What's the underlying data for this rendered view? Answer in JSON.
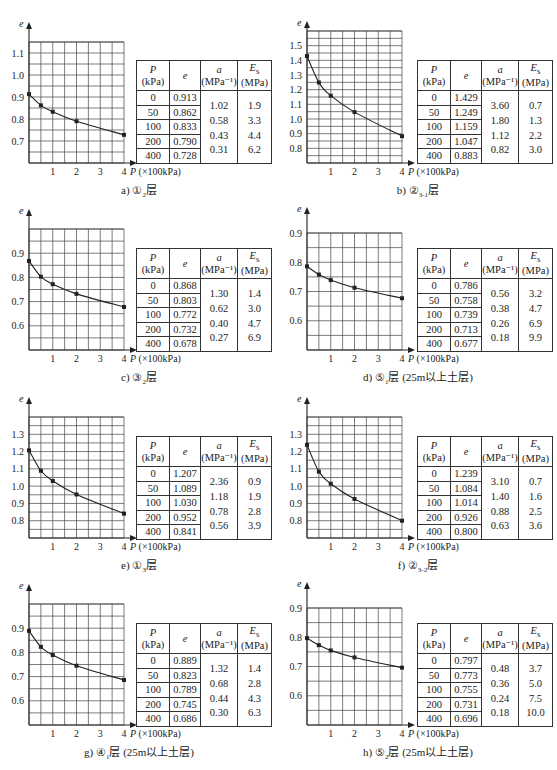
{
  "axis": {
    "y_label": "e",
    "x_label": "P (×100kPa)",
    "x_ticks": [
      "1",
      "2",
      "3",
      "4"
    ]
  },
  "table_headers": {
    "p": "P",
    "p_unit": "(kPa)",
    "e": "e",
    "a": "a",
    "a_unit": "(MPa⁻¹)",
    "es": "E",
    "es_sub": "s",
    "es_unit": "(MPa)"
  },
  "chart_data": [
    {
      "id": "a",
      "type": "line",
      "title": "a) ①₂层",
      "caption_prefix": "a) ①",
      "caption_sub": "2",
      "caption_suffix": "层",
      "xlabel": "P (×100kPa)",
      "ylabel": "e",
      "xlim": [
        0,
        4
      ],
      "ylim": [
        0.6,
        1.15
      ],
      "y_ticks": [
        0.7,
        0.8,
        0.9,
        1.0,
        1.1
      ],
      "y_tick_labels": [
        "0.7",
        "0.8",
        "0.9",
        "1.0",
        "1.1"
      ],
      "grid": true,
      "x": [
        0,
        0.5,
        1,
        2,
        4
      ],
      "P_kPa": [
        "0",
        "50",
        "100",
        "200",
        "400"
      ],
      "e": [
        "0.913",
        "0.862",
        "0.833",
        "0.790",
        "0.728"
      ],
      "a": [
        "1.02",
        "0.58",
        "0.43",
        "0.31"
      ],
      "Es": [
        "1.9",
        "3.3",
        "4.4",
        "6.2"
      ]
    },
    {
      "id": "b",
      "type": "line",
      "title": "b) ②₃₋₁层",
      "caption_prefix": "b) ②",
      "caption_sub": "3-1",
      "caption_suffix": "层",
      "xlabel": "P (×100kPa)",
      "ylabel": "e",
      "xlim": [
        0,
        4
      ],
      "ylim": [
        0.7,
        1.6
      ],
      "y_ticks": [
        0.8,
        0.9,
        1.0,
        1.1,
        1.2,
        1.3,
        1.4,
        1.5
      ],
      "y_tick_labels": [
        "0.8",
        "0.9",
        "1.0",
        "1.1",
        "1.2",
        "1.3",
        "1.4",
        "1.5"
      ],
      "grid": true,
      "x": [
        0,
        0.5,
        1,
        2,
        4
      ],
      "P_kPa": [
        "0",
        "50",
        "100",
        "200",
        "400"
      ],
      "e": [
        "1.429",
        "1.249",
        "1.159",
        "1.047",
        "0.883"
      ],
      "a": [
        "3.60",
        "1.80",
        "1.12",
        "0.82"
      ],
      "Es": [
        "0.7",
        "1.3",
        "2.2",
        "3.0"
      ]
    },
    {
      "id": "c",
      "type": "line",
      "title": "c) ③₂层",
      "caption_prefix": "c) ③",
      "caption_sub": "2",
      "caption_suffix": "层",
      "xlabel": "P (×100kPa)",
      "ylabel": "e",
      "xlim": [
        0,
        4
      ],
      "ylim": [
        0.5,
        1.0
      ],
      "y_ticks": [
        0.6,
        0.7,
        0.8,
        0.9
      ],
      "y_tick_labels": [
        "0.6",
        "0.7",
        "0.8",
        "0.9"
      ],
      "grid": true,
      "x": [
        0,
        0.5,
        1,
        2,
        4
      ],
      "P_kPa": [
        "0",
        "50",
        "100",
        "200",
        "400"
      ],
      "e": [
        "0.868",
        "0.803",
        "0.772",
        "0.732",
        "0.678"
      ],
      "a": [
        "1.30",
        "0.62",
        "0.40",
        "0.27"
      ],
      "Es": [
        "1.4",
        "3.0",
        "4.7",
        "6.9"
      ]
    },
    {
      "id": "d",
      "type": "line",
      "title": "d) ⑤₁层 (25m以上土层)",
      "caption_prefix": "d) ⑤",
      "caption_sub": "1",
      "caption_suffix": "层 (25m以上土层)",
      "xlabel": "P (×100kPa)",
      "ylabel": "e",
      "xlim": [
        0,
        4
      ],
      "ylim": [
        0.5,
        0.9
      ],
      "y_ticks": [
        0.6,
        0.7,
        0.8,
        0.9
      ],
      "y_tick_labels": [
        "0.6",
        "0.7",
        "0.8",
        "0.9"
      ],
      "grid": true,
      "x": [
        0,
        0.5,
        1,
        2,
        4
      ],
      "P_kPa": [
        "0",
        "50",
        "100",
        "200",
        "400"
      ],
      "e": [
        "0.786",
        "0.758",
        "0.739",
        "0.713",
        "0.677"
      ],
      "a": [
        "0.56",
        "0.38",
        "0.26",
        "0.18"
      ],
      "Es": [
        "3.2",
        "4.7",
        "6.9",
        "9.9"
      ]
    },
    {
      "id": "e",
      "type": "line",
      "title": "e) ①₃层",
      "caption_prefix": "e) ①",
      "caption_sub": "3",
      "caption_suffix": "层",
      "xlabel": "P (×100kPa)",
      "ylabel": "e",
      "xlim": [
        0,
        4
      ],
      "ylim": [
        0.7,
        1.4
      ],
      "y_ticks": [
        0.8,
        0.9,
        1.0,
        1.1,
        1.2,
        1.3
      ],
      "y_tick_labels": [
        "0.8",
        "0.9",
        "1.0",
        "1.1",
        "1.2",
        "1.3"
      ],
      "grid": true,
      "x": [
        0,
        0.5,
        1,
        2,
        4
      ],
      "P_kPa": [
        "0",
        "50",
        "100",
        "200",
        "400"
      ],
      "e": [
        "1.207",
        "1.089",
        "1.030",
        "0.952",
        "0.841"
      ],
      "a": [
        "2.36",
        "1.18",
        "0.78",
        "0.56"
      ],
      "Es": [
        "0.9",
        "1.9",
        "2.8",
        "3.9"
      ]
    },
    {
      "id": "f",
      "type": "line",
      "title": "f) ②₃₋₂层",
      "caption_prefix": "f) ②",
      "caption_sub": "3-2",
      "caption_suffix": "层",
      "xlabel": "P (×100kPa)",
      "ylabel": "e",
      "xlim": [
        0,
        4
      ],
      "ylim": [
        0.7,
        1.4
      ],
      "y_ticks": [
        0.8,
        0.9,
        1.0,
        1.1,
        1.2,
        1.3
      ],
      "y_tick_labels": [
        "0.8",
        "0.9",
        "1.0",
        "1.1",
        "1.2",
        "1.3"
      ],
      "grid": true,
      "x": [
        0,
        0.5,
        1,
        2,
        4
      ],
      "P_kPa": [
        "0",
        "50",
        "100",
        "200",
        "400"
      ],
      "e": [
        "1.239",
        "1.084",
        "1.014",
        "0.926",
        "0.800"
      ],
      "a": [
        "3.10",
        "1.40",
        "0.88",
        "0.63"
      ],
      "Es": [
        "0.7",
        "1.6",
        "2.5",
        "3.6"
      ]
    },
    {
      "id": "g",
      "type": "line",
      "title": "g) ④₁层 (25m以上土层)",
      "caption_prefix": "g) ④",
      "caption_sub": "1",
      "caption_suffix": "层 (25m以上土层)",
      "xlabel": "P (×100kPa)",
      "ylabel": "e",
      "xlim": [
        0,
        4
      ],
      "ylim": [
        0.5,
        1.0
      ],
      "y_ticks": [
        0.6,
        0.7,
        0.8,
        0.9
      ],
      "y_tick_labels": [
        "0.6",
        "0.7",
        "0.8",
        "0.9"
      ],
      "grid": true,
      "x": [
        0,
        0.5,
        1,
        2,
        4
      ],
      "P_kPa": [
        "0",
        "50",
        "100",
        "200",
        "400"
      ],
      "e": [
        "0.889",
        "0.823",
        "0.789",
        "0.745",
        "0.686"
      ],
      "a": [
        "1.32",
        "0.68",
        "0.44",
        "0.30"
      ],
      "Es": [
        "1.4",
        "2.8",
        "4.3",
        "6.3"
      ]
    },
    {
      "id": "h",
      "type": "line",
      "title": "h) ⑤₂层 (25m以上土层)",
      "caption_prefix": "h) ⑤",
      "caption_sub": "2",
      "caption_suffix": "层 (25m以上土层)",
      "xlabel": "P (×100kPa)",
      "ylabel": "e",
      "xlim": [
        0,
        4
      ],
      "ylim": [
        0.5,
        0.9
      ],
      "y_ticks": [
        0.6,
        0.7,
        0.8,
        0.9
      ],
      "y_tick_labels": [
        "0.6",
        "0.7",
        "0.8",
        "0.9"
      ],
      "grid": true,
      "x": [
        0,
        0.5,
        1,
        2,
        4
      ],
      "P_kPa": [
        "0",
        "50",
        "100",
        "200",
        "400"
      ],
      "e": [
        "0.797",
        "0.773",
        "0.755",
        "0.731",
        "0.696"
      ],
      "a": [
        "0.48",
        "0.36",
        "0.24",
        "0.18"
      ],
      "Es": [
        "3.7",
        "5.0",
        "7.5",
        "10.0"
      ]
    }
  ]
}
